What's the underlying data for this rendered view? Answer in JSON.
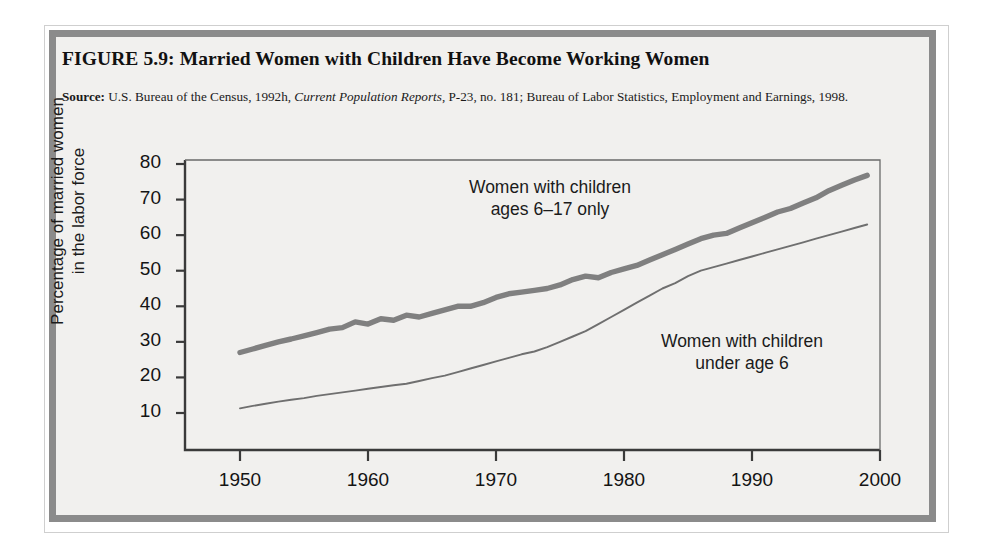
{
  "figure": {
    "title": "FIGURE 5.9:  Married Women with Children Have Become Working Women",
    "source_label": "Source:",
    "source_text_1": " U.S. Bureau of the Census, 1992h, ",
    "source_italic": "Current Population Reports",
    "source_text_2": ", P-23, no. 181; Bureau of Labor Statistics, Employment and Earnings, 1998."
  },
  "colors": {
    "frame": "#8b8b8b",
    "panel": "#f1f0ee",
    "axis": "#3a3a3a",
    "series_thick": "#808080",
    "series_thin": "#6f6f6f",
    "text": "#141414"
  },
  "chart_data": {
    "type": "line",
    "title": "Married Women with Children Have Become Working Women",
    "xlabel": "",
    "ylabel": "Percentage of married women in the labor force",
    "ylabel_line1": "Percentage of married women",
    "ylabel_line2": "in the labor force",
    "xlim": [
      1948,
      2000
    ],
    "ylim": [
      0.6,
      80
    ],
    "yticks": [
      10,
      20,
      30,
      40,
      50,
      60,
      70,
      80
    ],
    "xticks": [
      1950,
      1960,
      1970,
      1980,
      1990,
      2000
    ],
    "grid": false,
    "legend": "annotations-on-plot",
    "annotations": [
      {
        "id": "annot-ages-6-17",
        "line1": "Women with children",
        "line2": "ages 6–17 only",
        "x": 1968,
        "y": 71
      },
      {
        "id": "annot-under-6",
        "line1": "Women with children",
        "line2": "under age 6",
        "x": 1985,
        "y": 28
      }
    ],
    "series": [
      {
        "name": "Women with children ages 6–17 only",
        "style": "thick",
        "color": "#808080",
        "x": [
          1950,
          1951,
          1952,
          1953,
          1954,
          1955,
          1956,
          1957,
          1958,
          1959,
          1960,
          1961,
          1962,
          1963,
          1964,
          1965,
          1966,
          1967,
          1968,
          1969,
          1970,
          1971,
          1972,
          1973,
          1974,
          1975,
          1976,
          1977,
          1978,
          1979,
          1980,
          1981,
          1982,
          1983,
          1984,
          1985,
          1986,
          1987,
          1988,
          1989,
          1990,
          1991,
          1992,
          1993,
          1994,
          1995,
          1996,
          1997,
          1998,
          1999
        ],
        "values": [
          27.0,
          28.0,
          29.0,
          30.0,
          30.8,
          31.7,
          32.6,
          33.6,
          34.0,
          35.6,
          35.0,
          36.5,
          36.1,
          37.5,
          37.0,
          38.0,
          39.0,
          40.0,
          40.0,
          41.0,
          42.5,
          43.5,
          44.0,
          44.5,
          45.0,
          46.0,
          47.5,
          48.5,
          48.0,
          49.5,
          50.5,
          51.5,
          53.0,
          54.5,
          56.0,
          57.5,
          59.0,
          60.0,
          60.5,
          62.0,
          63.5,
          65.0,
          66.5,
          67.5,
          69.0,
          70.5,
          72.5,
          74.0,
          75.5,
          76.8
        ]
      },
      {
        "name": "Women with children under age 6",
        "style": "thin",
        "color": "#6f6f6f",
        "x": [
          1950,
          1951,
          1952,
          1953,
          1954,
          1955,
          1956,
          1957,
          1958,
          1959,
          1960,
          1961,
          1962,
          1963,
          1964,
          1965,
          1966,
          1967,
          1968,
          1969,
          1970,
          1971,
          1972,
          1973,
          1974,
          1975,
          1976,
          1977,
          1978,
          1979,
          1980,
          1981,
          1982,
          1983,
          1984,
          1985,
          1986,
          1987,
          1988,
          1989,
          1990,
          1991,
          1992,
          1993,
          1994,
          1995,
          1996,
          1997,
          1998,
          1999
        ],
        "values": [
          11.3,
          12.0,
          12.6,
          13.2,
          13.7,
          14.2,
          14.8,
          15.3,
          15.8,
          16.3,
          16.8,
          17.3,
          17.8,
          18.2,
          19.0,
          19.8,
          20.5,
          21.5,
          22.5,
          23.5,
          24.5,
          25.5,
          26.5,
          27.3,
          28.5,
          30.0,
          31.5,
          33.0,
          35.0,
          37.0,
          39.0,
          41.0,
          43.0,
          45.0,
          46.5,
          48.5,
          50.0,
          51.0,
          52.0,
          53.0,
          54.0,
          55.0,
          56.0,
          57.0,
          58.0,
          59.0,
          60.0,
          61.0,
          62.0,
          63.0
        ]
      }
    ]
  }
}
